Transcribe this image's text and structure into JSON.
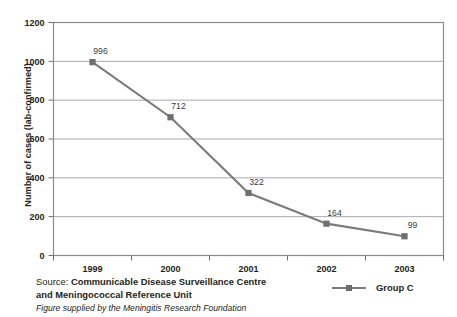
{
  "chart_data": {
    "type": "line",
    "title": "",
    "xlabel": "",
    "ylabel": "Number of cases (lab-confirmed)",
    "categories": [
      "1999",
      "2000",
      "2001",
      "2002",
      "2003"
    ],
    "series": [
      {
        "name": "Group C",
        "values": [
          996,
          712,
          322,
          164,
          99
        ],
        "color": "#7b7b7b",
        "marker": "square"
      }
    ],
    "point_labels": [
      "996",
      "712",
      "322",
      "164",
      "99"
    ],
    "ylim": [
      0,
      1200
    ],
    "yticks": [
      0,
      200,
      400,
      600,
      800,
      1000,
      1200
    ],
    "ytick_labels": [
      "0",
      "200",
      "400",
      "600",
      "800",
      "1000",
      "1200"
    ],
    "grid": true,
    "grid_axis": "y",
    "grid_color": "#a9a9a9",
    "legend_position": "bottom-right",
    "frame_color": "#8c8c8c"
  },
  "legend": {
    "entries": [
      {
        "label": "Group C"
      }
    ]
  },
  "footer": {
    "source_label": "Source:",
    "source_name_line1": "Communicable Disease Surveillance Centre",
    "source_name_line2": "and Meningococcal Reference Unit",
    "credit": "Figure supplied by the Meningitis Research Foundation"
  }
}
